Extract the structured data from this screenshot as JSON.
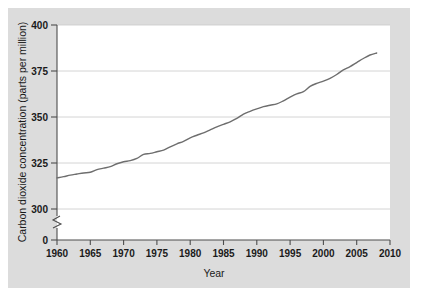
{
  "figure": {
    "background_color": "#ffffff",
    "panel_color": "#dcdcdc",
    "plot_color": "#ffffff"
  },
  "chart_data": {
    "type": "line",
    "title": "",
    "subtitle": "",
    "xlabel": "Year",
    "ylabel": "Carbon dioxide concentration (parts per million)",
    "xlim": [
      1960,
      2010
    ],
    "ylim": [
      300,
      400
    ],
    "y_axis_break": true,
    "y_break_label": "0",
    "grid": true,
    "grid_orientation": "horizontal",
    "legend": false,
    "legend_position": "none",
    "xticks": [
      1960,
      1965,
      1970,
      1975,
      1980,
      1985,
      1990,
      1995,
      2000,
      2005,
      2010
    ],
    "xtick_labels": [
      "1960",
      "1965",
      "1970",
      "1975",
      "1980",
      "1985",
      "1990",
      "1995",
      "2000",
      "2005",
      "2010"
    ],
    "yticks": [
      0,
      300,
      325,
      350,
      375,
      400
    ],
    "ytick_labels": [
      "0",
      "300",
      "325",
      "350",
      "375",
      "400"
    ],
    "line_color": "#6e6e6e",
    "line_width": 1.4,
    "series": [
      {
        "name": "Atmospheric CO2 concentration",
        "x": [
          1960,
          1961,
          1962,
          1963,
          1964,
          1965,
          1966,
          1967,
          1968,
          1969,
          1970,
          1971,
          1972,
          1973,
          1974,
          1975,
          1976,
          1977,
          1978,
          1979,
          1980,
          1981,
          1982,
          1983,
          1984,
          1985,
          1986,
          1987,
          1988,
          1989,
          1990,
          1991,
          1992,
          1993,
          1994,
          1995,
          1996,
          1997,
          1998,
          1999,
          2000,
          2001,
          2002,
          2003,
          2004,
          2005,
          2006,
          2007,
          2008
        ],
        "values": [
          316.9,
          317.6,
          318.4,
          319.0,
          319.6,
          320.0,
          321.4,
          322.2,
          323.0,
          324.6,
          325.7,
          326.3,
          327.5,
          329.7,
          330.2,
          331.1,
          332.0,
          333.8,
          335.4,
          336.8,
          338.7,
          340.1,
          341.4,
          343.0,
          344.6,
          346.0,
          347.4,
          349.2,
          351.6,
          353.1,
          354.4,
          355.6,
          356.4,
          357.1,
          358.8,
          360.8,
          362.6,
          363.8,
          366.6,
          368.3,
          369.5,
          371.0,
          373.1,
          375.6,
          377.4,
          379.6,
          381.8,
          383.7,
          384.8
        ]
      }
    ],
    "annotations": []
  }
}
